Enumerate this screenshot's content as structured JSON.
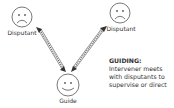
{
  "diagram": {
    "nodes": [
      {
        "id": "disputant-left",
        "label": "Disputant",
        "icon": "sad-face-icon"
      },
      {
        "id": "disputant-right",
        "label": "Disputant",
        "icon": "sad-face-icon"
      },
      {
        "id": "guide",
        "label": "Guide",
        "icon": "happy-face-icon"
      }
    ],
    "edges": [
      {
        "from": "disputant-left",
        "to": "guide",
        "style": "double-headed-striped-arrow"
      },
      {
        "from": "disputant-right",
        "to": "guide",
        "style": "double-headed-striped-arrow"
      }
    ],
    "caption": {
      "title": "GUIDING:",
      "lines": [
        "Intervener meets",
        "with disputants to",
        "supervise or direct"
      ]
    },
    "colors": {
      "stroke": "#555555",
      "text": "#333333",
      "background": "#ffffff"
    }
  }
}
